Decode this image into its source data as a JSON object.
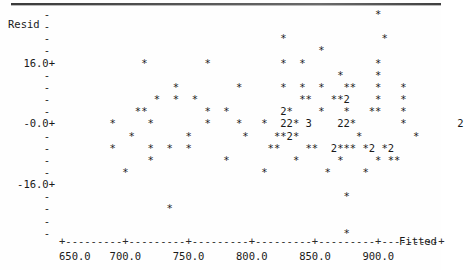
{
  "plot": {
    "style": "minitab-character-plot",
    "ylabel": "Resid",
    "xlabel": "Fitted",
    "plot_symbol": "*",
    "ink_color": "#1a1a1a"
  },
  "yaxis": {
    "major_ticks": [
      "16.0+",
      "-0.0+",
      "-16.0+"
    ],
    "minor_tick_mark": "-",
    "tick_label_16": "16.0+",
    "tick_label_0": "-0.0+",
    "tick_label_neg16": "-16.0+"
  },
  "xaxis": {
    "axis_line": "+---------+---------+---------+---------+---------+---------+",
    "tick_labels": [
      "650.0",
      "700.0",
      "750.0",
      "800.0",
      "850.0",
      "900.0"
    ],
    "name": "Fitted",
    "range": [
      637,
      912
    ]
  },
  "chart_data": {
    "type": "scatter",
    "title": "",
    "xlabel": "Fitted",
    "ylabel": "Resid",
    "xlim": [
      637,
      912
    ],
    "ylim": [
      -32,
      30
    ],
    "xticks": [
      650.0,
      700.0,
      750.0,
      800.0,
      850.0,
      900.0
    ],
    "yticks": [
      16.0,
      -0.0,
      -16.0
    ],
    "grid": false,
    "legend": null,
    "marker": "*",
    "overplot_digits": {
      "2": "two points in one cell",
      "3": "three points in one cell"
    },
    "rows": [
      {
        "y": 29.0,
        "text": "                                                  *"
      },
      {
        "y": 26.0,
        "text": ""
      },
      {
        "y": 23.0,
        "text": "                                   *               *"
      },
      {
        "y": 20.0,
        "text": "                                         *"
      },
      {
        "y": 16.0,
        "text": "             *         *           *  *           *"
      },
      {
        "y": 13.0,
        "text": "                                            *     *"
      },
      {
        "y": 10.0,
        "text": "                  *         *      *  *  *   **   *   *"
      },
      {
        "y": 7.0,
        "text": "               *  *  *                **   **2    *   *"
      },
      {
        "y": 4.0,
        "text": "            **         *  *        2*    *   *   **   *"
      },
      {
        "y": 0.0,
        "text": "        *     *        *    *   *  22* 3    22*       *        2"
      },
      {
        "y": -3.0,
        "text": "           *        *        *    **2*         *        *"
      },
      {
        "y": -6.0,
        "text": "        *     *  *  *            **    **  2*** *2 *2"
      },
      {
        "y": -9.0,
        "text": "              *           *          *      *     * **"
      },
      {
        "y": -12.0,
        "text": "          *                     *         *     *"
      },
      {
        "y": -16.0,
        "text": ""
      },
      {
        "y": -19.0,
        "text": "                                             *"
      },
      {
        "y": -22.0,
        "text": "                 *"
      },
      {
        "y": -26.0,
        "text": ""
      },
      {
        "y": -29.0,
        "text": "                                             *"
      }
    ],
    "points_approx": [
      {
        "x": 852,
        "y": 29
      },
      {
        "x": 782,
        "y": 23
      },
      {
        "x": 852,
        "y": 23
      },
      {
        "x": 812,
        "y": 20
      },
      {
        "x": 662,
        "y": 16
      },
      {
        "x": 702,
        "y": 16
      },
      {
        "x": 782,
        "y": 16
      },
      {
        "x": 796,
        "y": 16
      },
      {
        "x": 852,
        "y": 16
      },
      {
        "x": 830,
        "y": 13
      },
      {
        "x": 872,
        "y": 13
      },
      {
        "x": 682,
        "y": 10
      },
      {
        "x": 722,
        "y": 10
      },
      {
        "x": 770,
        "y": 10
      },
      {
        "x": 790,
        "y": 10
      },
      {
        "x": 806,
        "y": 10
      },
      {
        "x": 836,
        "y": 10
      },
      {
        "x": 844,
        "y": 10
      },
      {
        "x": 872,
        "y": 10
      },
      {
        "x": 674,
        "y": 7
      },
      {
        "x": 684,
        "y": 7
      },
      {
        "x": 694,
        "y": 7
      },
      {
        "x": 776,
        "y": 7
      },
      {
        "x": 784,
        "y": 7
      },
      {
        "x": 806,
        "y": 7
      },
      {
        "x": 814,
        "y": 7
      },
      {
        "x": 820,
        "y": 7
      },
      {
        "x": 666,
        "y": 4
      },
      {
        "x": 672,
        "y": 4
      },
      {
        "x": 730,
        "y": 4
      },
      {
        "x": 750,
        "y": 4
      },
      {
        "x": 790,
        "y": 4
      },
      {
        "x": 836,
        "y": 4
      },
      {
        "x": 848,
        "y": 4
      },
      {
        "x": 864,
        "y": 4
      },
      {
        "x": 648,
        "y": 0
      },
      {
        "x": 676,
        "y": 0
      },
      {
        "x": 724,
        "y": 0
      },
      {
        "x": 752,
        "y": 0
      },
      {
        "x": 770,
        "y": 0
      },
      {
        "x": 788,
        "y": 0
      },
      {
        "x": 800,
        "y": 0
      },
      {
        "x": 826,
        "y": 0
      },
      {
        "x": 896,
        "y": 0
      },
      {
        "x": 690,
        "y": -3
      },
      {
        "x": 740,
        "y": -3
      },
      {
        "x": 782,
        "y": -3
      },
      {
        "x": 792,
        "y": -3
      },
      {
        "x": 846,
        "y": -3
      },
      {
        "x": 890,
        "y": -3
      },
      {
        "x": 660,
        "y": -6
      },
      {
        "x": 690,
        "y": -6
      },
      {
        "x": 706,
        "y": -6
      },
      {
        "x": 718,
        "y": -6
      },
      {
        "x": 786,
        "y": -6
      },
      {
        "x": 812,
        "y": -6
      },
      {
        "x": 836,
        "y": -6
      },
      {
        "x": 856,
        "y": -6
      },
      {
        "x": 868,
        "y": -6
      },
      {
        "x": 700,
        "y": -9
      },
      {
        "x": 760,
        "y": -9
      },
      {
        "x": 820,
        "y": -9
      },
      {
        "x": 856,
        "y": -9
      },
      {
        "x": 876,
        "y": -9
      },
      {
        "x": 676,
        "y": -12
      },
      {
        "x": 784,
        "y": -12
      },
      {
        "x": 840,
        "y": -12
      },
      {
        "x": 880,
        "y": -19
      },
      {
        "x": 728,
        "y": -22
      },
      {
        "x": 884,
        "y": -29
      }
    ]
  }
}
